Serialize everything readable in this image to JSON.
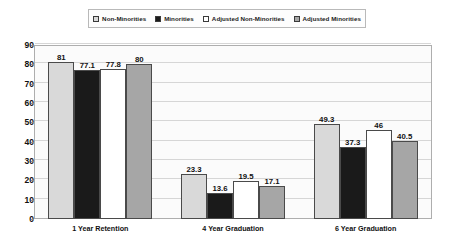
{
  "chart_data": {
    "type": "bar",
    "title": "",
    "subtitle": "",
    "xlabel": "",
    "ylabel": "",
    "ylim": [
      0,
      90
    ],
    "ytick_step": 10,
    "yticks": [
      "90",
      "80",
      "70",
      "60",
      "50",
      "40",
      "30",
      "20",
      "10",
      "0"
    ],
    "grid": true,
    "legend_position": "top-center",
    "categories": [
      "1 Year Retention",
      "4 Year Graduation",
      "6 Year Graduation"
    ],
    "series": [
      {
        "name": "Non-Minorities",
        "color": "#d9d9d9",
        "values": [
          81,
          23.3,
          49.3
        ],
        "labels": [
          "81",
          "23.3",
          "49.3"
        ]
      },
      {
        "name": "Minorities",
        "color": "#1a1a1a",
        "values": [
          77.1,
          13.6,
          37.3
        ],
        "labels": [
          "77.1",
          "13.6",
          "37.3"
        ]
      },
      {
        "name": "Adjusted Non-Minorities",
        "color": "#ffffff",
        "values": [
          77.8,
          19.5,
          46
        ],
        "labels": [
          "77.8",
          "19.5",
          "46"
        ]
      },
      {
        "name": "Adjusted Minorities",
        "color": "#a6a6a6",
        "values": [
          80,
          17.1,
          40.5
        ],
        "labels": [
          "80",
          "17.1",
          "40.5"
        ]
      }
    ]
  },
  "legend": {
    "items": [
      {
        "label": "Non-Minorities",
        "color": "#d9d9d9"
      },
      {
        "label": "Minorities",
        "color": "#1a1a1a"
      },
      {
        "label": "Adjusted Non-Minorities",
        "color": "#ffffff"
      },
      {
        "label": "Adjusted Minorities",
        "color": "#a6a6a6"
      }
    ]
  },
  "colors": {
    "plot_background": "#fbfbfb",
    "page_background": "#ffffff",
    "gridline": "#d6d6d6",
    "axis_border": "#aeaeae",
    "bar_outline": "#4a4a4a",
    "text": "#111111"
  }
}
